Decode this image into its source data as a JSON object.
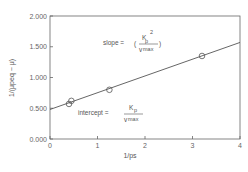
{
  "chart_data": {
    "type": "scatter",
    "title": "",
    "xlabel": "1/ps",
    "ylabel": "1/(μpeq − μ)",
    "xlim": [
      0,
      4
    ],
    "ylim": [
      0,
      2.0
    ],
    "x_ticks": [
      "0",
      "1",
      "2",
      "3",
      "4"
    ],
    "y_ticks": [
      "0.000",
      "0.500",
      "1.000",
      "1.500",
      "2.000"
    ],
    "grid": false,
    "legend": null,
    "series": [
      {
        "name": "data",
        "marker": "open-circle",
        "x": [
          0.4,
          0.45,
          1.25,
          3.2
        ],
        "y": [
          0.57,
          0.62,
          0.8,
          1.35
        ]
      },
      {
        "name": "fit",
        "type": "line",
        "x": [
          0,
          4
        ],
        "y": [
          0.48,
          1.57
        ]
      }
    ],
    "annotations": [
      {
        "text": "slope = (Kp² / vmax)",
        "parts": {
          "label": "slope =",
          "numerator": "K",
          "numerator_sub": "p",
          "numerator_sup": "2",
          "denominator": "v",
          "denominator_sub": "max"
        }
      },
      {
        "text": "intercept = Kp / vmax",
        "parts": {
          "label": "intercept =",
          "numerator": "K",
          "numerator_sub": "p",
          "denominator": "v",
          "denominator_sub": "max"
        }
      }
    ]
  },
  "labels": {
    "x_axis": "1/ps",
    "y_axis": "1/(μpeq − μ)",
    "slope_label": "slope =",
    "intercept_label": "intercept =",
    "K": "K",
    "p": "p",
    "sup2": "2",
    "v": "v",
    "max": "max",
    "lparen": "(",
    "rparen": ")"
  },
  "colors": {
    "axis": "#666666",
    "line": "#555555",
    "marker": "#555555",
    "background": "#ffffff"
  }
}
